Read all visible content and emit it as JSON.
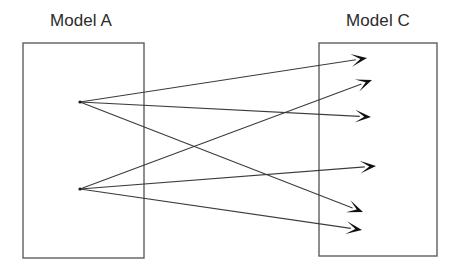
{
  "diagram": {
    "type": "bipartite-arrow-diagram",
    "background_color": "#ffffff",
    "box_stroke_color": "#585858",
    "line_color": "#3c3c3c",
    "arrow_color": "#111111",
    "label_color": "#2b2b2b",
    "boxes": [
      {
        "id": "model-a",
        "label": "Model A",
        "label_x": 81,
        "label_y": 26,
        "x": 23,
        "y": 43,
        "width": 121,
        "height": 215
      },
      {
        "id": "model-c",
        "label": "Model C",
        "label_x": 378,
        "label_y": 26,
        "x": 319,
        "y": 43,
        "width": 118,
        "height": 213
      }
    ],
    "source_nodes": [
      {
        "id": "a-top",
        "x": 80,
        "y": 102
      },
      {
        "id": "a-bottom",
        "x": 80,
        "y": 189
      }
    ],
    "target_points": [
      {
        "id": "c-1",
        "x": 367,
        "y": 58
      },
      {
        "id": "c-2",
        "x": 372,
        "y": 80
      },
      {
        "id": "c-3",
        "x": 371,
        "y": 117
      },
      {
        "id": "c-4",
        "x": 376,
        "y": 166
      },
      {
        "id": "c-5",
        "x": 363,
        "y": 212
      },
      {
        "id": "c-6",
        "x": 362,
        "y": 230
      }
    ],
    "edges": [
      {
        "id": "edge-1",
        "from": "a-top",
        "to": "c-1",
        "x1": 80,
        "y1": 102,
        "x2": 367,
        "y2": 58
      },
      {
        "id": "edge-2",
        "from": "a-top",
        "to": "c-3",
        "x1": 80,
        "y1": 102,
        "x2": 371,
        "y2": 117
      },
      {
        "id": "edge-3",
        "from": "a-top",
        "to": "c-5",
        "x1": 80,
        "y1": 102,
        "x2": 363,
        "y2": 212
      },
      {
        "id": "edge-4",
        "from": "a-bottom",
        "to": "c-2",
        "x1": 80,
        "y1": 189,
        "x2": 372,
        "y2": 80
      },
      {
        "id": "edge-5",
        "from": "a-bottom",
        "to": "c-4",
        "x1": 80,
        "y1": 189,
        "x2": 376,
        "y2": 166
      },
      {
        "id": "edge-6",
        "from": "a-bottom",
        "to": "c-6",
        "x1": 80,
        "y1": 189,
        "x2": 362,
        "y2": 230
      }
    ],
    "edge_count": 6,
    "source_node_count": 2,
    "target_arrow_count": 6
  }
}
